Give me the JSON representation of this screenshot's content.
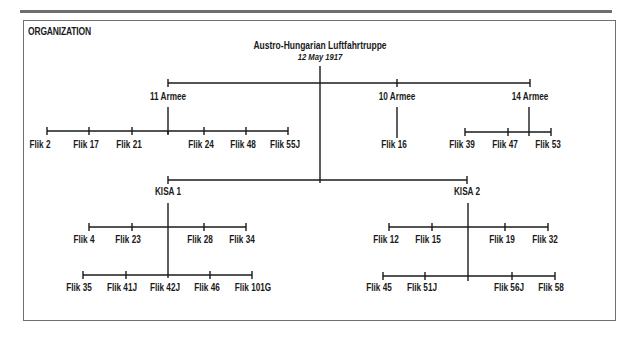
{
  "heading": "ORGANIZATION",
  "root": {
    "title": "Austro-Hungarian Luftfahrtruppe",
    "date": "12 May 1917"
  },
  "armees": [
    {
      "name": "11 Armee",
      "fliks": [
        "Flik 2",
        "Flik 17",
        "Flik 21",
        "Flik 24",
        "Flik 48",
        "Flik 55J"
      ]
    },
    {
      "name": "10 Armee",
      "fliks": [
        "Flik 16"
      ]
    },
    {
      "name": "14 Armee",
      "fliks": [
        "Flik 39",
        "Flik 47",
        "Flik 53"
      ]
    }
  ],
  "kisas": [
    {
      "name": "KISA 1",
      "row1": [
        "Flik 4",
        "Flik 23",
        "Flik 28",
        "Flik 34"
      ],
      "row2": [
        "Flik 35",
        "Flik 41J",
        "Flik 42J",
        "Flik 46",
        "Flik 101G"
      ]
    },
    {
      "name": "KISA 2",
      "row1": [
        "Flik 12",
        "Flik 15",
        "Flik 19",
        "Flik 32"
      ],
      "row2": [
        "Flik 45",
        "Flik 51J",
        "Flik 56J",
        "Flik 58"
      ]
    }
  ],
  "colors": {
    "line": "#1a1a1a",
    "frame": "#707070",
    "rule": "#6e6e6e"
  }
}
